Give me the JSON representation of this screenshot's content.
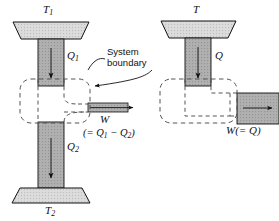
{
  "figure": {
    "type": "thermodynamics-schematic",
    "background_color": "#ffffff",
    "stroke_color": "#111111",
    "fill_gray": "#a8a8a8",
    "fill_light_gray": "#d8d8d8",
    "dashed_color": "#4a4a4a"
  },
  "annotations": {
    "system_boundary_line1": "System",
    "system_boundary_line2": "boundary"
  },
  "left_diagram": {
    "name": "heat-engine-two-reservoir",
    "hot_reservoir_label": "T",
    "hot_reservoir_sub": "1",
    "cold_reservoir_label": "T",
    "cold_reservoir_sub": "2",
    "heat_in_label": "Q",
    "heat_in_sub": "1",
    "heat_out_label": "Q",
    "heat_out_sub": "2",
    "work_label": "W",
    "work_expr_open": "(= Q",
    "work_expr_sub1": "1",
    "work_expr_minus": " − Q",
    "work_expr_sub2": "2",
    "work_expr_close": ")"
  },
  "right_diagram": {
    "name": "single-reservoir-engine",
    "reservoir_label": "T",
    "heat_label": "Q",
    "work_label": "W(= Q)"
  }
}
